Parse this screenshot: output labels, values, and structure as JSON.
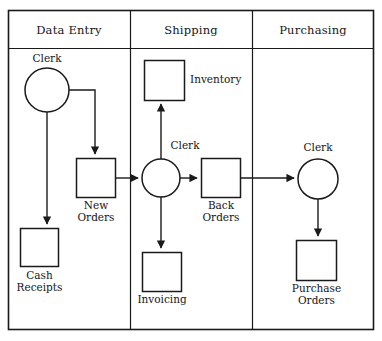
{
  "diagram": {
    "type": "swimlane-flowchart",
    "frame": {
      "x": 8,
      "y": 10,
      "width": 366,
      "height": 320
    },
    "header_divider_y": 48,
    "stroke_color": "#1a1a1a",
    "fill_color": "#ffffff",
    "lanes": [
      {
        "id": "data-entry",
        "title": "Data Entry",
        "x": 8,
        "width": 122
      },
      {
        "id": "shipping",
        "title": "Shipping",
        "x": 130,
        "width": 122
      },
      {
        "id": "purchasing",
        "title": "Purchasing",
        "x": 252,
        "width": 122
      }
    ],
    "nodes": [
      {
        "id": "clerk-data-entry",
        "lane": "data-entry",
        "shape": "circle",
        "label": "Clerk",
        "label_position": "above",
        "cx": 47,
        "cy": 90,
        "r": 22
      },
      {
        "id": "cash-receipts",
        "lane": "data-entry",
        "shape": "box",
        "label": "Cash\nReceipts",
        "label_position": "below",
        "x": 20,
        "y": 228,
        "width": 38,
        "height": 38
      },
      {
        "id": "new-orders",
        "lane": "data-entry",
        "shape": "box",
        "label": "New\nOrders",
        "label_position": "below",
        "x": 76,
        "y": 158,
        "width": 39,
        "height": 39
      },
      {
        "id": "inventory",
        "lane": "shipping",
        "shape": "box",
        "label": "Inventory",
        "label_position": "right",
        "x": 144,
        "y": 60,
        "width": 40,
        "height": 40
      },
      {
        "id": "clerk-shipping",
        "lane": "shipping",
        "shape": "circle",
        "label": "Clerk",
        "label_position": "above",
        "cx": 161,
        "cy": 178,
        "r": 19
      },
      {
        "id": "invoicing",
        "lane": "shipping",
        "shape": "box",
        "label": "Invoicing",
        "label_position": "below",
        "x": 142,
        "y": 252,
        "width": 39,
        "height": 39
      },
      {
        "id": "back-orders",
        "lane": "shipping",
        "shape": "box",
        "label": "Back\nOrders",
        "label_position": "below",
        "x": 201,
        "y": 158,
        "width": 39,
        "height": 39
      },
      {
        "id": "clerk-purchasing",
        "lane": "purchasing",
        "shape": "circle",
        "label": "Clerk",
        "label_position": "above",
        "cx": 318,
        "cy": 179,
        "r": 20
      },
      {
        "id": "purchase-orders",
        "lane": "purchasing",
        "shape": "box",
        "label": "Purchase\nOrders",
        "label_position": "below",
        "x": 296,
        "y": 240,
        "width": 40,
        "height": 40
      }
    ],
    "connectors": [
      {
        "id": "clerk-to-cash-receipts",
        "from": "clerk-data-entry",
        "to": "cash-receipts",
        "style": "vertical"
      },
      {
        "id": "clerk-to-new-orders",
        "from": "clerk-data-entry",
        "to": "new-orders",
        "style": "elbow"
      },
      {
        "id": "new-orders-to-clerk-shipping",
        "from": "new-orders",
        "to": "clerk-shipping",
        "style": "horizontal"
      },
      {
        "id": "clerk-shipping-to-inventory",
        "from": "clerk-shipping",
        "to": "inventory",
        "style": "vertical-up"
      },
      {
        "id": "clerk-shipping-to-invoicing",
        "from": "clerk-shipping",
        "to": "invoicing",
        "style": "vertical-down"
      },
      {
        "id": "clerk-shipping-to-back-orders",
        "from": "clerk-shipping",
        "to": "back-orders",
        "style": "horizontal"
      },
      {
        "id": "back-orders-to-clerk-purchasing",
        "from": "back-orders",
        "to": "clerk-purchasing",
        "style": "horizontal"
      },
      {
        "id": "clerk-purchasing-to-purchase-orders",
        "from": "clerk-purchasing",
        "to": "purchase-orders",
        "style": "vertical-down"
      }
    ]
  }
}
